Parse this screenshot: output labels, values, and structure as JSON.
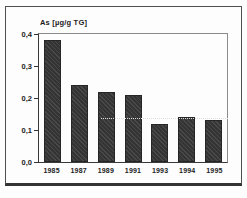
{
  "figure": {
    "title": "As [µg/g TG]"
  },
  "chart_data": {
    "type": "bar",
    "title": "As [µg/g TG]",
    "categories": [
      "1985",
      "1987",
      "1989",
      "1991",
      "1993",
      "1994",
      "1995"
    ],
    "values": [
      0.38,
      0.24,
      0.22,
      0.21,
      0.12,
      0.14,
      0.13
    ],
    "xlabel": "",
    "ylabel": "As [µg/g TG]",
    "ylim": [
      0,
      0.4
    ],
    "y_ticks": [
      {
        "value": 0.4,
        "label": "0,4"
      },
      {
        "value": 0.3,
        "label": "0,3"
      },
      {
        "value": 0.2,
        "label": "0,2"
      },
      {
        "value": 0.1,
        "label": "0,1"
      },
      {
        "value": 0.0,
        "label": "0,0"
      }
    ],
    "grid": false,
    "legend": false,
    "decimal_separator": ","
  },
  "colors": {
    "bar": "#3b3b3b",
    "axis": "#3a3a3a",
    "plot_border": "#8a8a8a",
    "frame_border": "#4f4f4f",
    "background": "#fdfdfd",
    "text": "#1c1c1c"
  }
}
